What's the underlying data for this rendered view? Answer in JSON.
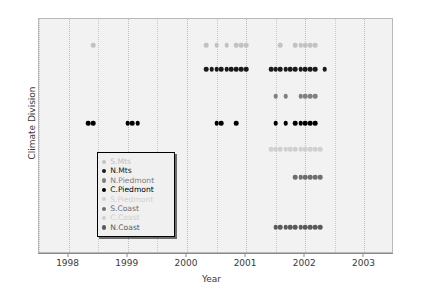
{
  "chart_data": {
    "type": "scatter",
    "title": "",
    "xlabel": "Year",
    "ylabel": "Climate Division",
    "xlim": [
      1997.5,
      2003.5
    ],
    "xticks": [
      1998,
      1999,
      2000,
      2001,
      2002,
      2003
    ],
    "xticklabels": [
      "1998",
      "1999",
      "2000",
      "2001",
      "2002",
      "2003"
    ],
    "ylim": [
      0,
      9
    ],
    "yticks": [],
    "yticklabels": [],
    "grid": "vertical-dotted",
    "legend_position": "lower-left-inset",
    "categories": [
      "S.Mts",
      "N.Mts",
      "N.Piedmont",
      "C.Piedmont",
      "S.Piedmont",
      "S.Coast",
      "C.Coast",
      "N.Coast"
    ],
    "series": [
      {
        "name": "S.Mts",
        "color": "#c2c2c2",
        "row": 8,
        "x": [
          1998.42,
          2000.33,
          2000.5,
          2000.67,
          2000.83,
          2000.92,
          2001.0,
          2001.58,
          2001.83,
          2001.92,
          2002.0,
          2002.08,
          2002.17
        ],
        "values": [
          8,
          8,
          8,
          8,
          8,
          8,
          8,
          8,
          8,
          8,
          8,
          8,
          8
        ]
      },
      {
        "name": "N.Mts",
        "color": "#1a1a1a",
        "row": 7,
        "x": [
          2000.33,
          2000.42,
          2000.5,
          2000.58,
          2000.67,
          2000.75,
          2000.83,
          2000.92,
          2001.0,
          2001.42,
          2001.5,
          2001.58,
          2001.67,
          2001.75,
          2001.83,
          2001.92,
          2002.0,
          2002.08,
          2002.17,
          2002.33
        ],
        "values": [
          7,
          7,
          7,
          7,
          7,
          7,
          7,
          7,
          7,
          7,
          7,
          7,
          7,
          7,
          7,
          7,
          7,
          7,
          7,
          7
        ]
      },
      {
        "name": "N.Piedmont",
        "color": "#808080",
        "row": 6,
        "x": [
          2001.5,
          2001.67,
          2001.92,
          2002.0,
          2002.08,
          2002.17
        ],
        "values": [
          6,
          6,
          6,
          6,
          6,
          6
        ]
      },
      {
        "name": "C.Piedmont",
        "color": "#000000",
        "row": 5,
        "x": [
          1998.33,
          1998.42,
          1999.0,
          1999.08,
          1999.17,
          2000.5,
          2000.58,
          2000.83,
          2001.5,
          2001.67,
          2001.83,
          2001.92,
          2002.0,
          2002.08,
          2002.17
        ],
        "values": [
          5,
          5,
          5,
          5,
          5,
          5,
          5,
          5,
          5,
          5,
          5,
          5,
          5,
          5,
          5
        ]
      },
      {
        "name": "S.Piedmont",
        "color": "#d0d0d0",
        "row": 4,
        "x": [
          2001.42,
          2001.5,
          2001.58,
          2001.67,
          2001.75,
          2001.83,
          2001.92,
          2002.0,
          2002.08,
          2002.17,
          2002.25
        ],
        "values": [
          4,
          4,
          4,
          4,
          4,
          4,
          4,
          4,
          4,
          4,
          4
        ]
      },
      {
        "name": "S.Coast",
        "color": "#6e6e6e",
        "row": 3,
        "x": [
          2001.83,
          2001.92,
          2002.0,
          2002.08,
          2002.17,
          2002.25
        ],
        "values": [
          3,
          3,
          3,
          3,
          3,
          3
        ]
      },
      {
        "name": "C.Coast",
        "color": "#cfcfcf",
        "row": 2,
        "x": [],
        "values": []
      },
      {
        "name": "N.Coast",
        "color": "#5a5a5a",
        "row": 1,
        "x": [
          2001.5,
          2001.58,
          2001.67,
          2001.75,
          2001.83,
          2001.92,
          2002.0,
          2002.08,
          2002.17,
          2002.25
        ],
        "values": [
          1,
          1,
          1,
          1,
          1,
          1,
          1,
          1,
          1,
          1
        ]
      }
    ]
  },
  "axis": {
    "xlabel": "Year",
    "ylabel": "Climate Division",
    "xticklabels": [
      "1998",
      "1999",
      "2000",
      "2001",
      "2002",
      "2003"
    ]
  },
  "legend": {
    "entries": [
      {
        "label": "S.Mts",
        "color": "#c2c2c2"
      },
      {
        "label": "N.Mts",
        "color": "#1a1a1a"
      },
      {
        "label": "N.Piedmont",
        "color": "#808080"
      },
      {
        "label": "C.Piedmont",
        "color": "#000000"
      },
      {
        "label": "S.Piedmont",
        "color": "#d0d0d0"
      },
      {
        "label": "S.Coast",
        "color": "#6e6e6e"
      },
      {
        "label": "C.Coast",
        "color": "#cfcfcf"
      },
      {
        "label": "N.Coast",
        "color": "#5a5a5a"
      }
    ]
  },
  "colors": {
    "panel_background": "#f2f2f2",
    "page_background": "#ffffff",
    "grid": "#c9c9c9",
    "axis": "#8a8a8a",
    "text": "#3a3a3a"
  }
}
